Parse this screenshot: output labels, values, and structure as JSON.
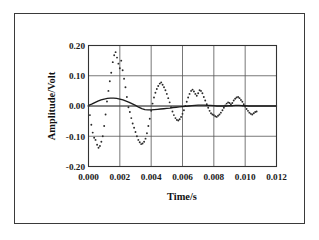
{
  "figure": {
    "background_color": "#ffffff",
    "border_color": "#3a3a3a"
  },
  "chart_data": {
    "type": "line",
    "title": "",
    "subtitle": "",
    "xlabel": "Time/s",
    "ylabel": "Amplitude/Volt",
    "xlim": [
      0.0,
      0.012
    ],
    "ylim": [
      -0.2,
      0.2
    ],
    "xticks": [
      0.0,
      0.002,
      0.004,
      0.006,
      0.008,
      0.01,
      0.012
    ],
    "xtick_labels": [
      "0.000",
      "0.002",
      "0.004",
      "0.006",
      "0.008",
      "0.010",
      "0.012"
    ],
    "yticks": [
      -0.2,
      -0.1,
      0.0,
      0.1,
      0.2
    ],
    "ytick_labels": [
      "-0.20",
      "-0.10",
      "0.00",
      "0.10",
      "0.20"
    ],
    "grid": true,
    "grid_x": true,
    "grid_y": true,
    "legend": false,
    "legend_position": "none",
    "annotations": [],
    "series": [
      {
        "name": "measured-response",
        "style": "dotted",
        "marker": "dot",
        "color": "#2a2a2a",
        "description": "Damped high-frequency oscillation, about 550 Hz, initial amplitude near 0.18 V decaying to about 0.03 V by 0.011 s",
        "points": [
          [
            0.0,
            0.0
          ],
          [
            9e-05,
            -0.03
          ],
          [
            0.00018,
            -0.062
          ],
          [
            0.00027,
            -0.088
          ],
          [
            0.00036,
            -0.105
          ],
          [
            0.00045,
            -0.112
          ],
          [
            0.00055,
            -0.128
          ],
          [
            0.00064,
            -0.138
          ],
          [
            0.00073,
            -0.132
          ],
          [
            0.00082,
            -0.118
          ],
          [
            0.00091,
            -0.1
          ],
          [
            0.001,
            -0.066
          ],
          [
            0.00109,
            -0.028
          ],
          [
            0.00118,
            0.015
          ],
          [
            0.00127,
            0.05
          ],
          [
            0.00136,
            0.082
          ],
          [
            0.00145,
            0.11
          ],
          [
            0.00155,
            0.145
          ],
          [
            0.00164,
            0.168
          ],
          [
            0.00173,
            0.178
          ],
          [
            0.00182,
            0.16
          ],
          [
            0.00191,
            0.14
          ],
          [
            0.002,
            0.125
          ],
          [
            0.00209,
            0.15
          ],
          [
            0.00218,
            0.118
          ],
          [
            0.00227,
            0.09
          ],
          [
            0.00236,
            0.062
          ],
          [
            0.00245,
            0.03
          ],
          [
            0.00255,
            -0.004
          ],
          [
            0.00264,
            -0.02
          ],
          [
            0.00273,
            -0.04
          ],
          [
            0.00282,
            -0.058
          ],
          [
            0.00291,
            -0.072
          ],
          [
            0.003,
            -0.086
          ],
          [
            0.00309,
            -0.1
          ],
          [
            0.00318,
            -0.112
          ],
          [
            0.00327,
            -0.12
          ],
          [
            0.00336,
            -0.126
          ],
          [
            0.00345,
            -0.124
          ],
          [
            0.00355,
            -0.118
          ],
          [
            0.00364,
            -0.108
          ],
          [
            0.00373,
            -0.09
          ],
          [
            0.00382,
            -0.066
          ],
          [
            0.00391,
            -0.042
          ],
          [
            0.004,
            -0.016
          ],
          [
            0.00409,
            0.008
          ],
          [
            0.00418,
            0.028
          ],
          [
            0.00427,
            0.044
          ],
          [
            0.00436,
            0.056
          ],
          [
            0.00445,
            0.066
          ],
          [
            0.00455,
            0.074
          ],
          [
            0.00464,
            0.078
          ],
          [
            0.00473,
            0.07
          ],
          [
            0.00482,
            0.062
          ],
          [
            0.00491,
            0.052
          ],
          [
            0.005,
            0.04
          ],
          [
            0.00509,
            0.026
          ],
          [
            0.00518,
            0.012
          ],
          [
            0.00527,
            -0.004
          ],
          [
            0.00536,
            -0.018
          ],
          [
            0.00545,
            -0.03
          ],
          [
            0.00555,
            -0.04
          ],
          [
            0.00564,
            -0.046
          ],
          [
            0.00573,
            -0.048
          ],
          [
            0.00582,
            -0.044
          ],
          [
            0.00591,
            -0.036
          ],
          [
            0.006,
            -0.026
          ],
          [
            0.00609,
            -0.014
          ],
          [
            0.00618,
            0.0
          ],
          [
            0.00627,
            0.014
          ],
          [
            0.00636,
            0.028
          ],
          [
            0.00645,
            0.04
          ],
          [
            0.00655,
            0.05
          ],
          [
            0.00664,
            0.054
          ],
          [
            0.00673,
            0.048
          ],
          [
            0.00682,
            0.04
          ],
          [
            0.00691,
            0.034
          ],
          [
            0.007,
            0.042
          ],
          [
            0.00709,
            0.052
          ],
          [
            0.00718,
            0.05
          ],
          [
            0.00727,
            0.042
          ],
          [
            0.00736,
            0.03
          ],
          [
            0.00745,
            0.018
          ],
          [
            0.00755,
            0.006
          ],
          [
            0.00764,
            -0.006
          ],
          [
            0.00773,
            -0.016
          ],
          [
            0.00782,
            -0.024
          ],
          [
            0.00791,
            -0.028
          ],
          [
            0.008,
            -0.03
          ],
          [
            0.00809,
            -0.034
          ],
          [
            0.00818,
            -0.036
          ],
          [
            0.00827,
            -0.032
          ],
          [
            0.00836,
            -0.028
          ],
          [
            0.00845,
            -0.022
          ],
          [
            0.00855,
            -0.014
          ],
          [
            0.00864,
            -0.006
          ],
          [
            0.00873,
            0.002
          ],
          [
            0.00882,
            0.008
          ],
          [
            0.00891,
            0.012
          ],
          [
            0.009,
            0.01
          ],
          [
            0.00909,
            0.006
          ],
          [
            0.00918,
            0.01
          ],
          [
            0.00927,
            0.018
          ],
          [
            0.00936,
            0.024
          ],
          [
            0.00945,
            0.028
          ],
          [
            0.00955,
            0.03
          ],
          [
            0.00964,
            0.026
          ],
          [
            0.00973,
            0.02
          ],
          [
            0.00982,
            0.014
          ],
          [
            0.00991,
            0.006
          ],
          [
            0.01,
            -0.002
          ],
          [
            0.01009,
            -0.01
          ],
          [
            0.01018,
            -0.016
          ],
          [
            0.01027,
            -0.022
          ],
          [
            0.01036,
            -0.026
          ],
          [
            0.01045,
            -0.028
          ],
          [
            0.01055,
            -0.024
          ],
          [
            0.01064,
            -0.02
          ],
          [
            0.01073,
            -0.018
          ]
        ]
      },
      {
        "name": "fitted-envelope",
        "style": "solid",
        "marker": "none",
        "color": "#1c1c1c",
        "description": "Smooth damped low-frequency curve, peak about 0.026 V near 0.0016 s, trough about -0.013 V near 0.0037 s, settling to near zero after 0.006 s",
        "points": [
          [
            0.0,
            0.002
          ],
          [
            0.0002,
            0.006
          ],
          [
            0.0004,
            0.011
          ],
          [
            0.0006,
            0.016
          ],
          [
            0.0008,
            0.02
          ],
          [
            0.001,
            0.023
          ],
          [
            0.0012,
            0.025
          ],
          [
            0.0014,
            0.026
          ],
          [
            0.0016,
            0.026
          ],
          [
            0.0018,
            0.025
          ],
          [
            0.002,
            0.023
          ],
          [
            0.0022,
            0.02
          ],
          [
            0.0024,
            0.016
          ],
          [
            0.0026,
            0.012
          ],
          [
            0.0028,
            0.007
          ],
          [
            0.003,
            0.002
          ],
          [
            0.0032,
            -0.004
          ],
          [
            0.0034,
            -0.009
          ],
          [
            0.0036,
            -0.012
          ],
          [
            0.0038,
            -0.013
          ],
          [
            0.004,
            -0.013
          ],
          [
            0.0042,
            -0.012
          ],
          [
            0.0044,
            -0.011
          ],
          [
            0.0046,
            -0.01
          ],
          [
            0.0048,
            -0.009
          ],
          [
            0.005,
            -0.008
          ],
          [
            0.0052,
            -0.007
          ],
          [
            0.0054,
            -0.005
          ],
          [
            0.0056,
            -0.004
          ],
          [
            0.0058,
            -0.003
          ],
          [
            0.006,
            -0.002
          ],
          [
            0.0062,
            -0.001
          ],
          [
            0.0064,
            0.0
          ],
          [
            0.0066,
            0.001
          ],
          [
            0.0068,
            0.002
          ],
          [
            0.007,
            0.003
          ],
          [
            0.0072,
            0.003
          ],
          [
            0.0074,
            0.003
          ],
          [
            0.0076,
            0.002
          ],
          [
            0.0078,
            0.002
          ],
          [
            0.008,
            0.001
          ],
          [
            0.0082,
            0.0
          ],
          [
            0.0084,
            0.0
          ],
          [
            0.0086,
            0.0
          ],
          [
            0.0088,
            0.0
          ],
          [
            0.009,
            0.001
          ],
          [
            0.0092,
            0.001
          ],
          [
            0.0094,
            0.002
          ],
          [
            0.0096,
            0.002
          ],
          [
            0.0098,
            0.001
          ],
          [
            0.01,
            0.001
          ],
          [
            0.0102,
            0.0
          ],
          [
            0.0104,
            0.0
          ],
          [
            0.0106,
            0.0
          ],
          [
            0.0108,
            0.0
          ],
          [
            0.011,
            0.0
          ],
          [
            0.0112,
            0.0
          ],
          [
            0.0114,
            0.0
          ],
          [
            0.0116,
            0.0
          ],
          [
            0.0118,
            0.0
          ],
          [
            0.012,
            0.0
          ]
        ]
      }
    ]
  }
}
